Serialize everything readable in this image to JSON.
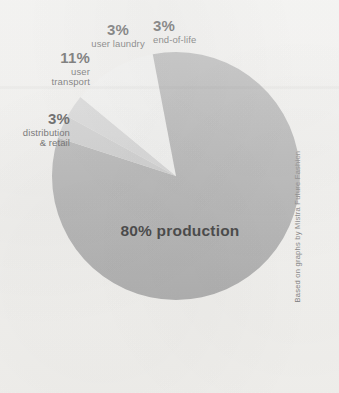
{
  "credit": "Based on graphs by Mistra Future Fashion",
  "colors": {
    "background": "#f2f1ee",
    "production": "#a8a8a8",
    "end_of_life": "#c8c8c8",
    "user_laundry": "#d2d2d2",
    "user_transport": "#f4f4f2",
    "distribution_retail": "#a8a8a8",
    "label_text": "#2b2b2b",
    "credit_text": "#6e6e6e"
  },
  "labels": {
    "production": {
      "pct": "80%",
      "name": "production",
      "combined": "80% production"
    },
    "end_of_life": {
      "pct": "3%",
      "name": "end-of-life"
    },
    "user_laundry": {
      "pct": "3%",
      "name": "user laundry"
    },
    "user_transport": {
      "pct": "11%",
      "name_line1": "user",
      "name_line2": "transport"
    },
    "distribution_retail": {
      "pct": "3%",
      "name_line1": "distribution",
      "name_line2": "& retail"
    }
  },
  "chart_data": {
    "type": "pie",
    "title": "",
    "subtitle": "",
    "xlabel": "",
    "ylabel": "",
    "legend_position": "callout-labels",
    "grid": false,
    "units": "percent",
    "total": 100,
    "start_angle_deg": 0,
    "direction": "clockwise",
    "center_px": [
      176,
      176
    ],
    "radius_px": 124,
    "categories": [
      "production",
      "end-of-life",
      "user laundry",
      "user transport",
      "distribution & retail"
    ],
    "values": [
      80,
      3,
      3,
      11,
      3
    ],
    "slices": [
      {
        "label": "production",
        "value": 80,
        "display": "80% production",
        "color": "#a8a8a8",
        "start_deg": 0,
        "end_deg": 288,
        "label_placement": "inside"
      },
      {
        "label": "end-of-life",
        "value": 3,
        "display": "3% end-of-life",
        "color": "#c8c8c8",
        "start_deg": 288,
        "end_deg": 298.8,
        "label_placement": "outside-top-right"
      },
      {
        "label": "user laundry",
        "value": 3,
        "display": "3% user laundry",
        "color": "#d2d2d2",
        "start_deg": 298.8,
        "end_deg": 309.6,
        "label_placement": "outside-top"
      },
      {
        "label": "user transport",
        "value": 11,
        "display": "11% user transport",
        "color": "#f4f4f2",
        "start_deg": 309.6,
        "end_deg": 349.2,
        "label_placement": "outside-upper-left"
      },
      {
        "label": "distribution & retail",
        "value": 3,
        "display": "3% distribution & retail",
        "color": "#a8a8a8",
        "start_deg": 349.2,
        "end_deg": 360,
        "label_placement": "outside-left"
      }
    ],
    "annotations": [
      "Based on graphs by Mistra Future Fashion"
    ]
  }
}
